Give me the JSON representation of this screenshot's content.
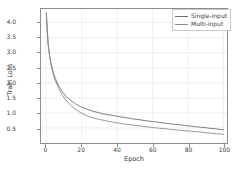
{
  "chart_data": {
    "type": "line",
    "title": "",
    "xlabel": "Epoch",
    "ylabel": "Train Loss",
    "xlim": [
      -3,
      102
    ],
    "ylim": [
      0.0,
      4.45
    ],
    "grid": true,
    "legend_position": "top-right",
    "xticks": [
      "0",
      "20",
      "40",
      "60",
      "80",
      "100"
    ],
    "xtick_values": [
      0,
      20,
      40,
      60,
      80,
      100
    ],
    "yticks": [
      "0.5",
      "1.0",
      "1.5",
      "2.0",
      "2.5",
      "3.0",
      "3.5",
      "4.0"
    ],
    "ytick_values": [
      0.5,
      1.0,
      1.5,
      2.0,
      2.5,
      3.0,
      3.5,
      4.0
    ],
    "x": [
      0,
      1,
      2,
      3,
      4,
      5,
      6,
      7,
      8,
      9,
      10,
      11,
      12,
      13,
      14,
      15,
      16,
      17,
      18,
      19,
      20,
      22,
      24,
      26,
      28,
      30,
      32,
      34,
      36,
      38,
      40,
      42,
      44,
      46,
      48,
      50,
      52,
      54,
      56,
      58,
      60,
      62,
      64,
      66,
      68,
      70,
      72,
      74,
      76,
      78,
      80,
      82,
      84,
      86,
      88,
      90,
      92,
      94,
      96,
      98,
      100
    ],
    "series": [
      {
        "name": "Single-input",
        "color": "#6e6e6e",
        "values": [
          4.32,
          3.31,
          2.85,
          2.55,
          2.33,
          2.16,
          2.02,
          1.9,
          1.8,
          1.71,
          1.63,
          1.56,
          1.5,
          1.45,
          1.4,
          1.36,
          1.32,
          1.28,
          1.25,
          1.22,
          1.19,
          1.14,
          1.1,
          1.06,
          1.03,
          1.0,
          0.97,
          0.95,
          0.93,
          0.91,
          0.89,
          0.87,
          0.85,
          0.83,
          0.81,
          0.79,
          0.78,
          0.76,
          0.74,
          0.73,
          0.71,
          0.7,
          0.68,
          0.67,
          0.65,
          0.64,
          0.62,
          0.61,
          0.6,
          0.58,
          0.57,
          0.56,
          0.54,
          0.53,
          0.52,
          0.51,
          0.49,
          0.48,
          0.47,
          0.45,
          0.44
        ]
      },
      {
        "name": "Multi-input",
        "color": "#8a8a8a",
        "values": [
          4.3,
          3.28,
          2.81,
          2.5,
          2.27,
          2.09,
          1.94,
          1.81,
          1.7,
          1.6,
          1.51,
          1.43,
          1.36,
          1.3,
          1.24,
          1.19,
          1.14,
          1.1,
          1.06,
          1.02,
          0.99,
          0.93,
          0.88,
          0.84,
          0.81,
          0.78,
          0.76,
          0.73,
          0.71,
          0.69,
          0.67,
          0.65,
          0.63,
          0.62,
          0.6,
          0.59,
          0.57,
          0.56,
          0.54,
          0.53,
          0.52,
          0.5,
          0.49,
          0.48,
          0.47,
          0.45,
          0.44,
          0.43,
          0.42,
          0.41,
          0.4,
          0.39,
          0.38,
          0.37,
          0.36,
          0.34,
          0.33,
          0.32,
          0.31,
          0.3,
          0.29
        ]
      }
    ]
  },
  "legend": {
    "items": [
      {
        "label": "Single-input"
      },
      {
        "label": "Multi-input"
      }
    ]
  },
  "axes": {
    "xlabel": "Epoch",
    "ylabel": "Train Loss"
  },
  "colors": {
    "axis": "#8e8e8e",
    "grid": "#e8e8e8",
    "background": "#ffffff",
    "series_single": "#6e6e6e",
    "series_multi": "#8a8a8a"
  }
}
